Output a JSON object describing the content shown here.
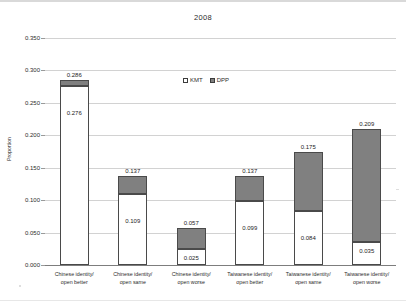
{
  "chart_data": {
    "type": "bar",
    "subtype": "stacked-column",
    "title": "2008",
    "xlabel": "",
    "ylabel": "Proportion",
    "ylim": [
      0.0,
      0.35
    ],
    "ytick_step": 0.05,
    "ytick_labels": [
      "0.000",
      "0.050",
      "0.100",
      "0.150",
      "0.200",
      "0.250",
      "0.300",
      "0.350"
    ],
    "ytick_values": [
      0.0,
      0.05,
      0.1,
      0.15,
      0.2,
      0.25,
      0.3,
      0.35
    ],
    "grid": true,
    "legend_position": "inside-top-center",
    "categories": [
      "Chinese identity/ open better",
      "Chinese identity/ open same",
      "Chinese identity/ open worse",
      "Taiwanese identity/ open better",
      "Taiwanese identity/ open same",
      "Taiwanese identity/ open worse"
    ],
    "category_lines": [
      [
        "Chinese identity/",
        "open better"
      ],
      [
        "Chinese identity/",
        "open same"
      ],
      [
        "Chinese identity/",
        "open worse"
      ],
      [
        "Taiwanese identity/",
        "open better"
      ],
      [
        "Taiwanese identity/",
        "open same"
      ],
      [
        "Taiwanese identity/",
        "open worse"
      ]
    ],
    "series": [
      {
        "name": "KMT",
        "color": "#ffffff",
        "values": [
          0.276,
          0.109,
          0.025,
          0.099,
          0.084,
          0.035
        ],
        "labels": [
          "0.276",
          "0.109",
          "0.025",
          "0.099",
          "0.084",
          "0.035"
        ]
      },
      {
        "name": "DPP",
        "color": "#808080",
        "values": [
          0.01,
          0.028,
          0.032,
          0.038,
          0.091,
          0.174
        ],
        "labels": [
          "",
          "",
          "",
          "",
          "",
          ""
        ]
      }
    ],
    "totals": [
      0.286,
      0.137,
      0.057,
      0.137,
      0.175,
      0.209
    ],
    "total_labels": [
      "0.286",
      "0.137",
      "0.057",
      "0.137",
      "0.175",
      "0.209"
    ]
  },
  "legend": {
    "items": [
      {
        "label": "KMT",
        "swatch": "white-square-marker"
      },
      {
        "label": "DPP",
        "swatch": "gray-square-marker"
      }
    ]
  },
  "colors": {
    "kmt": "#ffffff",
    "dpp": "#808080",
    "bar_border": "#4a4a4a",
    "gridline": "#d2d2d2",
    "axis": "#7d7d7d",
    "text": "#2b2b2b"
  }
}
